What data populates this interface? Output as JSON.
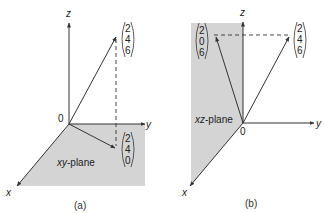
{
  "panels": [
    {
      "id": "a",
      "caption": "(a)",
      "plane_label": "xy-plane",
      "plane_label_italic": "xy",
      "plane_label_rest": "-plane",
      "axes": {
        "x": "x",
        "y": "y",
        "z": "z",
        "origin": "0"
      },
      "vectors": [
        {
          "name": "v",
          "components": [
            "2",
            "4",
            "6"
          ]
        },
        {
          "name": "projection_xy",
          "components": [
            "2",
            "4",
            "0"
          ]
        }
      ],
      "plane_color": "#d4d4d4"
    },
    {
      "id": "b",
      "caption": "(b)",
      "plane_label": "xz-plane",
      "plane_label_italic": "xz",
      "plane_label_rest": "-plane",
      "axes": {
        "x": "x",
        "y": "y",
        "z": "z",
        "origin": "0"
      },
      "vectors": [
        {
          "name": "projection_xz",
          "components": [
            "2",
            "0",
            "6"
          ]
        },
        {
          "name": "v",
          "components": [
            "2",
            "4",
            "6"
          ]
        }
      ],
      "plane_color": "#d4d4d4"
    }
  ]
}
